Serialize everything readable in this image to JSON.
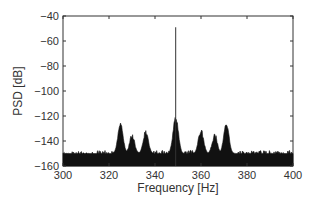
{
  "chart_data": {
    "type": "line",
    "title": "",
    "xlabel": "Frequency [Hz]",
    "ylabel": "PSD [dB]",
    "xlim": [
      300,
      400
    ],
    "ylim": [
      -160,
      -40
    ],
    "xticks": [
      300,
      320,
      340,
      360,
      380,
      400
    ],
    "yticks": [
      -40,
      -60,
      -80,
      -100,
      -120,
      -140,
      -160
    ],
    "grid": false,
    "legend": null,
    "series": [
      {
        "name": "PSD",
        "noise_floor_db": -150,
        "peaks": [
          {
            "x": 325,
            "y": -127
          },
          {
            "x": 330,
            "y": -136
          },
          {
            "x": 336,
            "y": -133
          },
          {
            "x": 349,
            "y": -49
          },
          {
            "x": 349,
            "y": -121
          },
          {
            "x": 360,
            "y": -132
          },
          {
            "x": 366,
            "y": -136
          },
          {
            "x": 371,
            "y": -127
          }
        ]
      }
    ]
  }
}
